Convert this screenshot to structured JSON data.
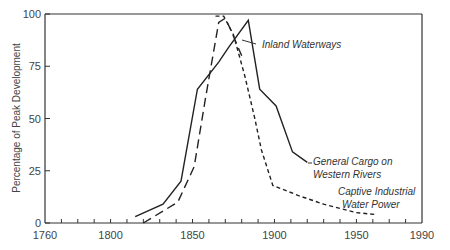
{
  "chart_data": {
    "type": "line",
    "title": "",
    "xlabel": "",
    "ylabel": "Percentage of Peak Development",
    "xlim": [
      1760,
      1990
    ],
    "ylim": [
      0,
      100
    ],
    "grid": false,
    "legend_position": "inline annotations",
    "x_ticks": [
      1760,
      1800,
      1850,
      1900,
      1950,
      1990
    ],
    "x_minor_tick_step": 10,
    "y_ticks": [
      0,
      25,
      50,
      75,
      100
    ],
    "series": [
      {
        "name": "General Cargo on Western Rivers",
        "style": "solid",
        "x": [
          1815,
          1832,
          1843,
          1853,
          1866,
          1872,
          1884,
          1891,
          1901,
          1911,
          1920
        ],
        "y": [
          3,
          9,
          20,
          64,
          77,
          84,
          97,
          64,
          56,
          34,
          29
        ]
      },
      {
        "name": "Inland Waterways",
        "style": "long-dash",
        "x": [
          1820,
          1841,
          1851,
          1858,
          1866,
          1870,
          1873,
          1880
        ],
        "y": [
          0,
          10,
          27,
          60,
          96,
          98,
          93,
          80
        ]
      },
      {
        "name": "Captive Industrial Water Power",
        "style": "short-dash",
        "x": [
          1864,
          1869,
          1875,
          1882,
          1888,
          1892,
          1899,
          1915,
          1930,
          1950,
          1962
        ],
        "y": [
          99,
          99,
          90,
          70,
          50,
          35,
          18,
          13,
          9,
          5,
          4
        ]
      }
    ],
    "annotations": [
      {
        "text": "Inland Waterways",
        "series": "Inland Waterways"
      },
      {
        "text": "General Cargo on",
        "series": "General Cargo on Western Rivers"
      },
      {
        "text": "Western Rivers",
        "series": "General Cargo on Western Rivers"
      },
      {
        "text": "Captive Industrial",
        "series": "Captive Industrial Water Power"
      },
      {
        "text": "Water Power",
        "series": "Captive Industrial Water Power"
      }
    ]
  },
  "labels": {
    "y_axis_title": "Percentage of Peak Development",
    "inland": "Inland Waterways",
    "cargo_line1": "General Cargo on",
    "cargo_line2": "Western Rivers",
    "power_line1": "Captive Industrial",
    "power_line2": "Water Power"
  }
}
